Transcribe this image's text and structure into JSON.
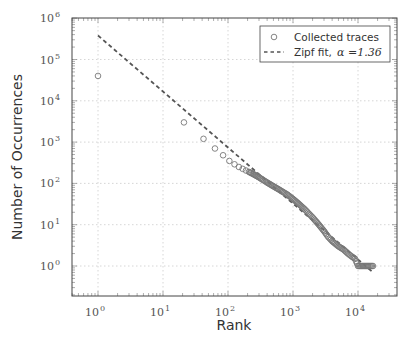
{
  "chart_data": {
    "type": "scatter",
    "title": "",
    "xlabel": "Rank",
    "ylabel": "Number of Occurrences",
    "xscale": "log",
    "yscale": "log",
    "xlim": [
      0.4,
      40000
    ],
    "ylim": [
      0.2,
      1000000
    ],
    "grid": true,
    "legend_position": "upper right",
    "x_ticks": [
      "10^0",
      "10^1",
      "10^2",
      "10^3",
      "10^4"
    ],
    "y_ticks": [
      "10^0",
      "10^1",
      "10^2",
      "10^3",
      "10^4",
      "10^5",
      "10^6"
    ],
    "legend": [
      {
        "label": "Collected traces",
        "marker": "open-circle"
      },
      {
        "label": "Zipf fit,",
        "math": "α = 1.36",
        "style": "dashed-line"
      }
    ],
    "series": [
      {
        "name": "Collected traces",
        "kind": "scatter",
        "marker": "open-circle",
        "color": "#777777",
        "points": [
          [
            1,
            40000
          ],
          [
            21,
            3000
          ],
          [
            42,
            1200
          ],
          [
            63,
            700
          ],
          [
            84,
            480
          ],
          [
            105,
            350
          ],
          [
            126,
            290
          ],
          [
            147,
            250
          ],
          [
            168,
            225
          ],
          [
            189,
            205
          ],
          [
            210,
            190
          ],
          [
            250,
            165
          ],
          [
            300,
            140
          ],
          [
            350,
            120
          ],
          [
            400,
            105
          ],
          [
            500,
            85
          ],
          [
            600,
            72
          ],
          [
            700,
            62
          ],
          [
            800,
            55
          ],
          [
            1000,
            42
          ],
          [
            1200,
            33
          ],
          [
            1500,
            24
          ],
          [
            2000,
            15
          ],
          [
            2500,
            10
          ],
          [
            3000,
            7
          ],
          [
            3500,
            5
          ],
          [
            4000,
            4
          ],
          [
            5000,
            3
          ],
          [
            6000,
            2.5
          ],
          [
            7000,
            2
          ],
          [
            8000,
            1.7
          ],
          [
            9000,
            1.5
          ],
          [
            10000,
            1
          ],
          [
            12000,
            1
          ],
          [
            14000,
            1
          ],
          [
            17000,
            1
          ]
        ]
      },
      {
        "name": "Zipf fit, α = 1.36",
        "kind": "line",
        "style": "dashed",
        "color": "#555555",
        "alpha": 1.36,
        "x": [
          1,
          17000
        ],
        "y": [
          380000,
          0.7
        ]
      }
    ]
  },
  "axes": {
    "x_tick_labels": [
      {
        "base": "10",
        "exp": "0"
      },
      {
        "base": "10",
        "exp": "1"
      },
      {
        "base": "10",
        "exp": "2"
      },
      {
        "base": "10",
        "exp": "3"
      },
      {
        "base": "10",
        "exp": "4"
      }
    ],
    "y_tick_labels": [
      {
        "base": "10",
        "exp": "0"
      },
      {
        "base": "10",
        "exp": "1"
      },
      {
        "base": "10",
        "exp": "2"
      },
      {
        "base": "10",
        "exp": "3"
      },
      {
        "base": "10",
        "exp": "4"
      },
      {
        "base": "10",
        "exp": "5"
      },
      {
        "base": "10",
        "exp": "6"
      }
    ],
    "xlabel": "Rank",
    "ylabel": "Number of Occurrences"
  },
  "legend": {
    "item1": "Collected traces",
    "item2": "Zipf fit,",
    "item2_math": "α =1.36"
  },
  "colors": {
    "marker": "#777777",
    "fit_line": "#555555",
    "grid": "#cccccc",
    "frame": "#444444"
  }
}
